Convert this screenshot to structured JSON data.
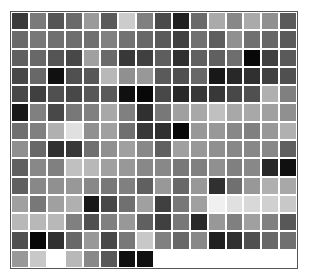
{
  "grid": {
    "columns": 16,
    "rows": 14,
    "cells": [
      [
        "#3a3a3a",
        "#7a7a7a",
        "#555555",
        "#6a6a6a",
        "#9a9a9a",
        "#5a5a5a",
        "#cccccc",
        "#808080",
        "#4a4a4a",
        "#202020",
        "#6a6a6a",
        "#aaaaaa",
        "#888888",
        "#aaaaaa",
        "#909090",
        "#5a5a5a"
      ],
      [
        "#6a6a6a",
        "#787878",
        "#707070",
        "#6e6e6e",
        "#707070",
        "#808080",
        "#727272",
        "#686868",
        "#5a5a5a",
        "#404040",
        "#707070",
        "#5e5e5e",
        "#909090",
        "#707070",
        "#686868",
        "#5a5a5a"
      ],
      [
        "#606060",
        "#686868",
        "#555555",
        "#484848",
        "#a0a0a0",
        "#6a6a6a",
        "#383838",
        "#404040",
        "#5e5e5e",
        "#303030",
        "#606060",
        "#606060",
        "#6e6e6e",
        "#080808",
        "#404040",
        "#5a5a5a"
      ],
      [
        "#484848",
        "#686868",
        "#101010",
        "#505050",
        "#585858",
        "#b8b8b8",
        "#909090",
        "#989898",
        "#5a5a5a",
        "#505050",
        "#686868",
        "#181818",
        "#282828",
        "#303030",
        "#404040",
        "#505050"
      ],
      [
        "#484848",
        "#404040",
        "#505050",
        "#484848",
        "#585858",
        "#5a5a5a",
        "#101010",
        "#080808",
        "#484848",
        "#282828",
        "#383838",
        "#383838",
        "#484848",
        "#505050",
        "#b0b0b0",
        "#808080"
      ],
      [
        "#181818",
        "#808080",
        "#484848",
        "#787878",
        "#808080",
        "#a8a8a8",
        "#808080",
        "#303030",
        "#787878",
        "#a0a0a0",
        "#a8a8a8",
        "#c0c0c0",
        "#a8a8a8",
        "#a8a8a8",
        "#a0a0a0",
        "#909090"
      ],
      [
        "#707070",
        "#808080",
        "#b0b0b0",
        "#e0e0e0",
        "#909090",
        "#a0a0a0",
        "#707070",
        "#383838",
        "#303030",
        "#080808",
        "#989898",
        "#989898",
        "#888888",
        "#808080",
        "#989898",
        "#b0b0b0"
      ],
      [
        "#909090",
        "#686868",
        "#303030",
        "#383838",
        "#707070",
        "#909090",
        "#a0a0a0",
        "#888888",
        "#606060",
        "#a0a0a0",
        "#989898",
        "#909090",
        "#888888",
        "#888888",
        "#888888",
        "#606060"
      ],
      [
        "#606060",
        "#888888",
        "#808080",
        "#c0c0c0",
        "#b8b8b8",
        "#a0a0a0",
        "#989898",
        "#888888",
        "#888888",
        "#787878",
        "#808080",
        "#909090",
        "#808080",
        "#888888",
        "#282828",
        "#101010"
      ],
      [
        "#606060",
        "#888888",
        "#909090",
        "#989898",
        "#888888",
        "#787878",
        "#808080",
        "#606060",
        "#989898",
        "#686868",
        "#989898",
        "#303030",
        "#707070",
        "#989898",
        "#b0b0b0",
        "#a8a8a8"
      ],
      [
        "#a0a0a0",
        "#787878",
        "#a0a0a0",
        "#b0b0b0",
        "#181818",
        "#484848",
        "#707070",
        "#a0a0a0",
        "#404040",
        "#787878",
        "#a0a0a0",
        "#f0f0f0",
        "#e0e0e0",
        "#d8d8d8",
        "#d0d0d0",
        "#c8c8c8"
      ],
      [
        "#b8b8b8",
        "#b8b8b8",
        "#b8b8b8",
        "#808080",
        "#505050",
        "#808080",
        "#989898",
        "#606060",
        "#404040",
        "#787878",
        "#282828",
        "#989898",
        "#808080",
        "#a0a0a0",
        "#808080",
        "#585858"
      ],
      [
        "#505050",
        "#080808",
        "#303030",
        "#686868",
        "#989898",
        "#484848",
        "#787878",
        "#c8c8c8",
        "#808080",
        "#686868",
        "#888888",
        "#202020",
        "#303030",
        "#505050",
        "#686868",
        "#707070"
      ],
      [
        "#989898",
        "#c8c8c8",
        "#ffffff",
        "#b8b8b8",
        "#888888",
        "#585858",
        "#101010",
        "#101010",
        null,
        null,
        null,
        null,
        null,
        null,
        null,
        null
      ]
    ]
  },
  "colors": {
    "frame_border": "#555555",
    "background": "#ffffff",
    "gap": "#ffffff"
  }
}
